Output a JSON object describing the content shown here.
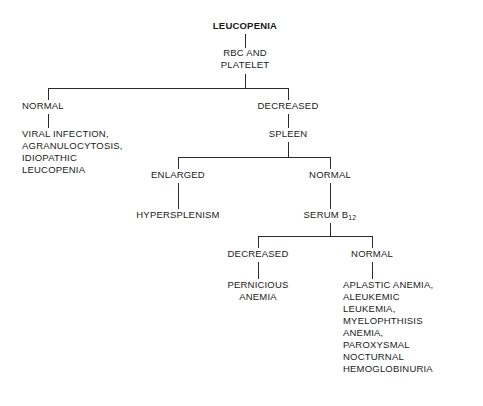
{
  "diagram": {
    "title": "LEUCOPENIA",
    "type": "flowchart",
    "nodes": {
      "root": "LEUCOPENIA",
      "test1": "RBC AND\nPLATELET",
      "branch1_left": "NORMAL",
      "branch1_left_result": "VIRAL INFECTION,\nAGRANULOCYTOSIS,\nIDIOPATHIC\nLEUCOPENIA",
      "branch1_right": "DECREASED",
      "test2": "SPLEEN",
      "branch2_left": "ENLARGED",
      "branch2_left_result": "HYPERSPLENISM",
      "branch2_right": "NORMAL",
      "test3_prefix": "SERUM B",
      "test3_sub": "12",
      "branch3_left": "DECREASED",
      "branch3_left_result": "PERNICIOUS\nANEMIA",
      "branch3_right": "NORMAL",
      "branch3_right_result": "APLASTIC ANEMIA,\nALEUKEMIC\nLEUKEMIA,\nMYELOPHTHISIS\nANEMIA,\nPAROXYSMAL\nNOCTURNAL\nHEMOGLOBINURIA"
    },
    "colors": {
      "background": "#ffffff",
      "text": "#1a1a1a",
      "line": "#2b2b2b"
    }
  }
}
